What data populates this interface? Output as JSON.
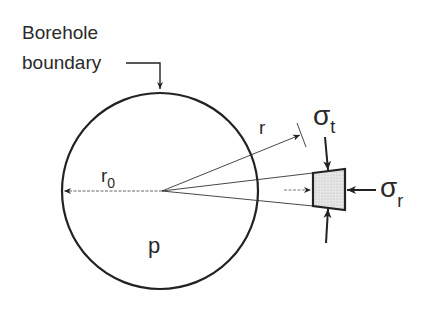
{
  "diagram": {
    "labels": {
      "boundary_line1": "Borehole",
      "boundary_line2": "boundary",
      "r": "r",
      "r0": "r",
      "r0_sub": "0",
      "p": "p",
      "sigma_t": "σ",
      "sigma_t_sub": "t",
      "sigma_r": "σ",
      "sigma_r_sub": "r"
    },
    "colors": {
      "stroke": "#222222",
      "element_fill": "#dcdcdc"
    }
  }
}
